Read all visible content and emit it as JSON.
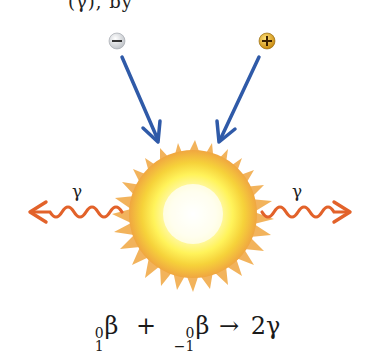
{
  "diagram": {
    "title_fragment": "(γ), by",
    "particles": {
      "electron": {
        "label": "−",
        "color": "#e8e8e8",
        "stroke": "#555555"
      },
      "positron": {
        "label": "+",
        "color": "#d9a21a",
        "stroke": "#4a2e00"
      }
    },
    "arrow_color": "#2f5aa8",
    "photon_color": "#e2622a",
    "burst": {
      "outer_color": "#f0a640",
      "inner_color": "#fff36a",
      "core_color": "#ffffff"
    },
    "photons": {
      "left_label": "γ",
      "right_label": "γ"
    },
    "equation": {
      "term1": {
        "mass_number": "0",
        "atomic_number": "1",
        "symbol": "β"
      },
      "plus": "+",
      "term2": {
        "mass_number": "0",
        "atomic_number": "−1",
        "symbol": "β"
      },
      "arrow": "→",
      "product": "2γ"
    }
  }
}
